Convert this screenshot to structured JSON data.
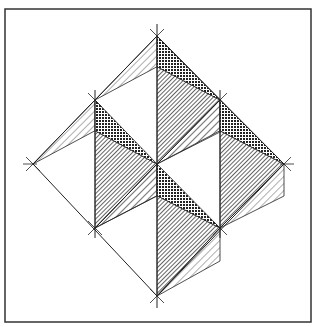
{
  "figure": {
    "frame": {
      "x": 5,
      "y": 9,
      "width": 306,
      "height": 313
    },
    "colors": {
      "line": "#222222",
      "dark": "#333333",
      "background": "#ffffff"
    },
    "vertices": {
      "top": [
        157,
        36
      ],
      "left": [
        33,
        164
      ],
      "right": [
        284,
        164
      ],
      "bottom": [
        157,
        296
      ],
      "mid_left": [
        95,
        100
      ],
      "mid_right": [
        220,
        100
      ],
      "low_left": [
        95,
        228
      ],
      "low_right": [
        220,
        228
      ],
      "center": [
        157,
        164
      ]
    },
    "modules": [
      {
        "top": [
          157,
          36
        ],
        "tip": [
          220,
          100
        ],
        "bottom": [
          157,
          164
        ],
        "left": [
          95,
          100
        ]
      },
      {
        "top": [
          95,
          100
        ],
        "tip": [
          157,
          164
        ],
        "bottom": [
          95,
          228
        ],
        "left": [
          33,
          164
        ]
      },
      {
        "top": [
          220,
          100
        ],
        "tip": [
          284,
          164
        ],
        "bottom": [
          220,
          228
        ],
        "left": [
          157,
          164
        ]
      },
      {
        "top": [
          157,
          164
        ],
        "tip": [
          220,
          228
        ],
        "bottom": [
          157,
          296
        ],
        "left": [
          95,
          228
        ]
      }
    ]
  }
}
